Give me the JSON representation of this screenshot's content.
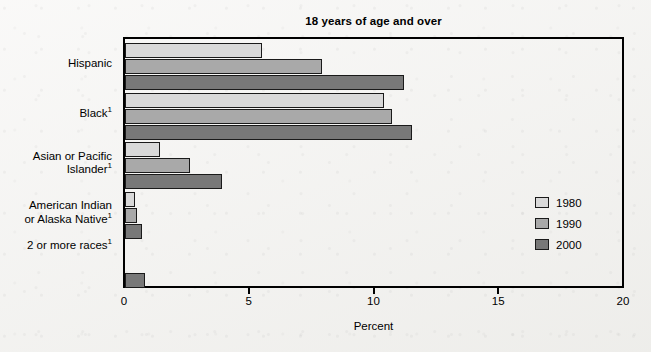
{
  "chart_data": {
    "type": "bar",
    "orientation": "horizontal",
    "title": "18 years of age and over",
    "xlabel": "Percent",
    "ylabel": "",
    "xlim": [
      0,
      20
    ],
    "xticks": [
      "0",
      "5",
      "10",
      "15",
      "20"
    ],
    "xtick_values": [
      0,
      5,
      10,
      15,
      20
    ],
    "grid": false,
    "legend_position": "right",
    "categories": [
      "Hispanic",
      "Black¹",
      "Asian or Pacific\nIslander¹",
      "American Indian\nor Alaska Native¹",
      "2 or more races¹"
    ],
    "series": [
      {
        "name": "1980",
        "color": "#d9d9d9",
        "values": [
          5.5,
          10.4,
          1.4,
          0.4,
          null
        ]
      },
      {
        "name": "1990",
        "color": "#a9a9a9",
        "values": [
          7.9,
          10.7,
          2.6,
          0.5,
          null
        ]
      },
      {
        "name": "2000",
        "color": "#787878",
        "values": [
          11.2,
          11.5,
          3.9,
          0.7,
          0.8
        ]
      }
    ]
  },
  "legend": {
    "items": [
      {
        "label": "1980",
        "color": "#d9d9d9"
      },
      {
        "label": "1990",
        "color": "#a9a9a9"
      },
      {
        "label": "2000",
        "color": "#787878"
      }
    ]
  },
  "axis": {
    "x_title": "Percent",
    "ticks": [
      "0",
      "5",
      "10",
      "15",
      "20"
    ]
  },
  "colors": {
    "background": "#f4f3f1",
    "frame": "#000000",
    "series_1980": "#d9d9d9",
    "series_1990": "#a9a9a9",
    "series_2000": "#787878"
  }
}
